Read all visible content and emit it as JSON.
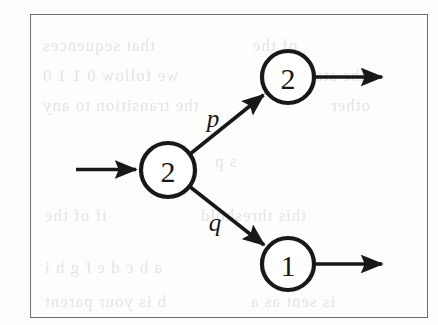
{
  "figure": {
    "kind": "state-transition-diagram",
    "border_color": "#6d6d6d",
    "ink_color": "#181818",
    "background_color": "#fdfdfc"
  },
  "nodes": [
    {
      "id": "start",
      "label": "2",
      "cx": 168,
      "cy": 170,
      "r": 27
    },
    {
      "id": "up",
      "label": "2",
      "cx": 288,
      "cy": 77,
      "r": 26
    },
    {
      "id": "down",
      "label": "1",
      "cx": 288,
      "cy": 264,
      "r": 26
    }
  ],
  "edges": [
    {
      "id": "edge-in",
      "label": "",
      "from": "",
      "to": "start"
    },
    {
      "id": "edge-start-up",
      "label": "p",
      "from": "start",
      "to": "up",
      "label_x": 213,
      "label_y": 118
    },
    {
      "id": "edge-start-down",
      "label": "q",
      "from": "start",
      "to": "down",
      "label_x": 215,
      "label_y": 222
    },
    {
      "id": "edge-up-out",
      "label": "",
      "from": "up",
      "to": ""
    },
    {
      "id": "edge-down-out",
      "label": "",
      "from": "down",
      "to": ""
    }
  ],
  "labels": {
    "probability_p": "p",
    "probability_q": "q",
    "node_start": "2",
    "node_up": "2",
    "node_down": "1"
  },
  "ghost_text": [
    {
      "text": "that sequences",
      "x": 42,
      "y": 36,
      "size": 17
    },
    {
      "text": "we follow 0 1 1 0",
      "x": 42,
      "y": 66,
      "size": 17
    },
    {
      "text": "the transition to any",
      "x": 42,
      "y": 96,
      "size": 17
    },
    {
      "text": "of the",
      "x": 252,
      "y": 36,
      "size": 17
    },
    {
      "text": "the state",
      "x": 300,
      "y": 66,
      "size": 17
    },
    {
      "text": "other",
      "x": 330,
      "y": 96,
      "size": 17
    },
    {
      "text": "s p",
      "x": 214,
      "y": 152,
      "size": 17
    },
    {
      "text": "this threshold",
      "x": 200,
      "y": 206,
      "size": 17
    },
    {
      "text": "if of the",
      "x": 44,
      "y": 206,
      "size": 17
    },
    {
      "text": "a b c d e f g h i",
      "x": 44,
      "y": 258,
      "size": 17
    },
    {
      "text": "b is your parent",
      "x": 44,
      "y": 292,
      "size": 17
    },
    {
      "text": "is sent as a",
      "x": 250,
      "y": 292,
      "size": 17
    }
  ]
}
